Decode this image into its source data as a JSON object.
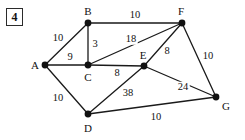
{
  "figure": {
    "badge_label": "4",
    "width": 245,
    "height": 140,
    "background_color": "#ffffff",
    "ink_color": "#111111"
  },
  "chart_data": {
    "type": "diagram",
    "diagram_kind": "weighted-undirected-graph",
    "title": "",
    "nodes": [
      {
        "id": "A",
        "label": "A",
        "x": 45,
        "y": 65,
        "label_x": 35,
        "label_y": 65
      },
      {
        "id": "B",
        "label": "B",
        "x": 88,
        "y": 23,
        "label_x": 88,
        "label_y": 11
      },
      {
        "id": "C",
        "label": "C",
        "x": 88,
        "y": 65,
        "label_x": 88,
        "label_y": 77
      },
      {
        "id": "D",
        "label": "D",
        "x": 88,
        "y": 114,
        "label_x": 88,
        "label_y": 128
      },
      {
        "id": "E",
        "label": "E",
        "x": 144,
        "y": 66,
        "label_x": 143,
        "label_y": 55
      },
      {
        "id": "F",
        "label": "F",
        "x": 182,
        "y": 23,
        "label_x": 181,
        "label_y": 11
      },
      {
        "id": "G",
        "label": "G",
        "x": 216,
        "y": 97,
        "label_x": 226,
        "label_y": 106
      }
    ],
    "edges": [
      {
        "from": "A",
        "to": "B",
        "weight": "10",
        "label_x": 58,
        "label_y": 38
      },
      {
        "from": "A",
        "to": "C",
        "weight": "9",
        "label_x": 70,
        "label_y": 57
      },
      {
        "from": "A",
        "to": "D",
        "weight": "10",
        "label_x": 58,
        "label_y": 98
      },
      {
        "from": "B",
        "to": "C",
        "weight": "3",
        "label_x": 95,
        "label_y": 44
      },
      {
        "from": "B",
        "to": "F",
        "weight": "10",
        "label_x": 135,
        "label_y": 15
      },
      {
        "from": "C",
        "to": "E",
        "weight": "8",
        "label_x": 117,
        "label_y": 73
      },
      {
        "from": "C",
        "to": "F",
        "weight": "18",
        "label_x": 131,
        "label_y": 39
      },
      {
        "from": "D",
        "to": "E",
        "weight": "38",
        "label_x": 128,
        "label_y": 93
      },
      {
        "from": "D",
        "to": "G",
        "weight": "10",
        "label_x": 156,
        "label_y": 117
      },
      {
        "from": "E",
        "to": "F",
        "weight": "8",
        "label_x": 167,
        "label_y": 51
      },
      {
        "from": "E",
        "to": "G",
        "weight": "24",
        "label_x": 183,
        "label_y": 87
      },
      {
        "from": "F",
        "to": "G",
        "weight": "10",
        "label_x": 208,
        "label_y": 56
      }
    ],
    "node_radius": 3.4,
    "edge_color": "#1a1a1a",
    "node_color": "#111111"
  }
}
